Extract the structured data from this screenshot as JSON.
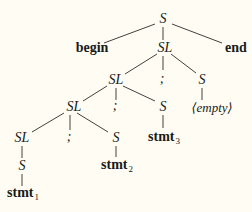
{
  "diagram": {
    "type": "parse-tree",
    "line_color": "#2a2a2a",
    "background": "#fffdf3",
    "nodes": {
      "root_S": "S",
      "begin": "begin",
      "sl1": "SL",
      "end": "end",
      "sl2": "SL",
      "semi1": ";",
      "s_empty": "S",
      "sl3": "SL",
      "semi2": ";",
      "s3": "S",
      "empty": "⟨empty⟩",
      "sl4": "SL",
      "semi3": ";",
      "s2": "S",
      "stmt3": "stmt",
      "stmt3_sub": "3",
      "s1": "S",
      "stmt2": "stmt",
      "stmt2_sub": "2",
      "stmt1": "stmt",
      "stmt1_sub": "1"
    }
  }
}
